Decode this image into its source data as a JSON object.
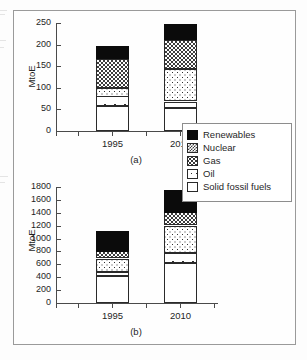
{
  "figure": {
    "y_axis_title": "MtoE",
    "captions": {
      "top": "(a)",
      "bottom": "(b)"
    }
  },
  "legend": {
    "items": [
      {
        "label": "Renewables",
        "key": "renewables",
        "swatch": "black-solid-swatch"
      },
      {
        "label": "Nuclear",
        "key": "nuclear",
        "swatch": "dense-checker-swatch"
      },
      {
        "label": "Gas",
        "key": "gas",
        "swatch": "dot-grid-swatch"
      },
      {
        "label": "Oil",
        "key": "oil",
        "swatch": "sparse-dot-swatch"
      },
      {
        "label": "Solid fossil fuels",
        "key": "solid",
        "swatch": "white-empty-swatch"
      }
    ]
  },
  "chart_data": [
    {
      "id": "chart-a",
      "type": "bar",
      "stacked": true,
      "title": "(a)",
      "xlabel": "",
      "ylabel": "MtoE",
      "ylim": [
        0,
        250
      ],
      "yticks": [
        0,
        50,
        100,
        150,
        200,
        250
      ],
      "ytick_labels": [
        "0",
        "50",
        "100",
        "150",
        "200",
        "250"
      ],
      "grid": false,
      "legend_position": "right",
      "categories": [
        "1995",
        "2010"
      ],
      "series": [
        {
          "name": "Solid fossil fuels",
          "key": "solid",
          "values": [
            57,
            54
          ]
        },
        {
          "name": "Oil",
          "key": "oil",
          "values": [
            23,
            14
          ]
        },
        {
          "name": "Gas",
          "key": "gas",
          "values": [
            20,
            75
          ]
        },
        {
          "name": "Nuclear",
          "key": "nuclear",
          "values": [
            67,
            68
          ]
        },
        {
          "name": "Renewables",
          "key": "renewables",
          "values": [
            29,
            37
          ]
        }
      ],
      "totals": [
        196,
        248
      ]
    },
    {
      "id": "chart-b",
      "type": "bar",
      "stacked": true,
      "title": "(b)",
      "xlabel": "",
      "ylabel": "MtoE",
      "ylim": [
        0,
        1800
      ],
      "yticks": [
        0,
        200,
        400,
        600,
        800,
        1000,
        1200,
        1400,
        1600,
        1800
      ],
      "ytick_labels": [
        "0",
        "200",
        "400",
        "600",
        "800",
        "1000",
        "1200",
        "1400",
        "1600",
        "1800"
      ],
      "grid": false,
      "legend_position": "right",
      "categories": [
        "1995",
        "2010"
      ],
      "series": [
        {
          "name": "Solid fossil fuels",
          "key": "solid",
          "values": [
            420,
            620
          ]
        },
        {
          "name": "Oil",
          "key": "oil",
          "values": [
            65,
            155
          ]
        },
        {
          "name": "Gas",
          "key": "gas",
          "values": [
            205,
            425
          ]
        },
        {
          "name": "Nuclear",
          "key": "nuclear",
          "values": [
            110,
            205
          ]
        },
        {
          "name": "Renewables",
          "key": "renewables",
          "values": [
            320,
            355
          ]
        }
      ],
      "totals": [
        1120,
        1755
      ]
    }
  ]
}
